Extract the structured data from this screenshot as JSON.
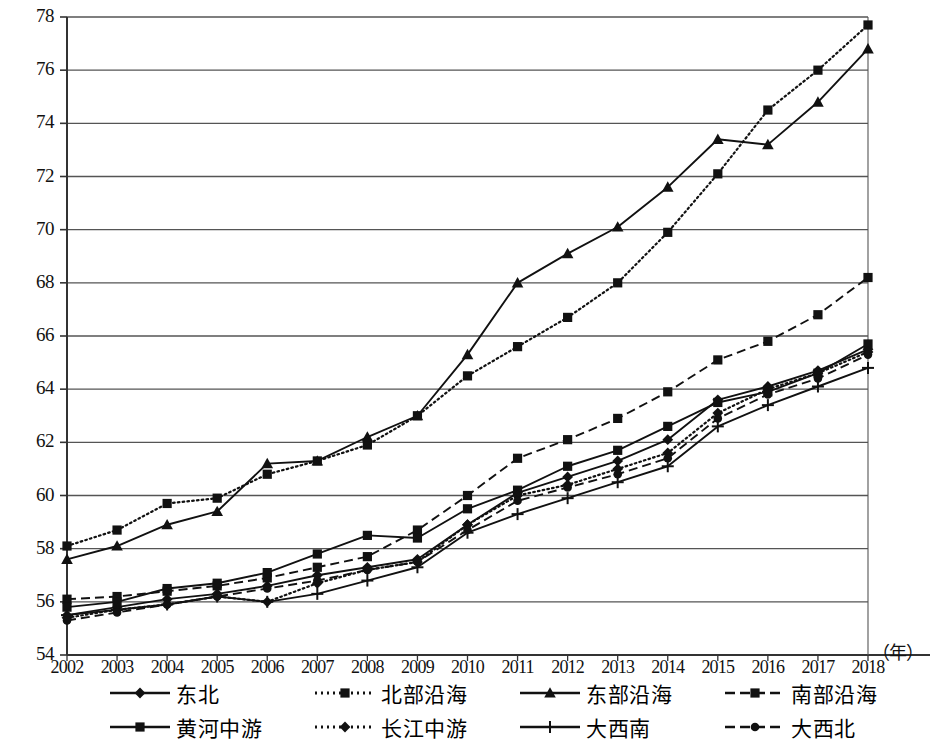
{
  "chart_data": {
    "type": "line",
    "title": "",
    "xlabel": "（年）",
    "ylabel": "",
    "grid": true,
    "legend_position": "bottom",
    "xlim": [
      2002,
      2018
    ],
    "ylim": [
      54,
      78
    ],
    "yticks": [
      54,
      56,
      58,
      60,
      62,
      64,
      66,
      68,
      70,
      72,
      74,
      76,
      78
    ],
    "categories": [
      "2002",
      "2003",
      "2004",
      "2005",
      "2006",
      "2007",
      "2008",
      "2009",
      "2010",
      "2011",
      "2012",
      "2013",
      "2014",
      "2015",
      "2016",
      "2017",
      "2018"
    ],
    "series": [
      {
        "name": "东北",
        "marker": "diamond",
        "line": "solid",
        "values": [
          55.5,
          55.8,
          56.1,
          56.3,
          56.6,
          57.0,
          57.3,
          57.6,
          58.9,
          60.1,
          60.7,
          61.3,
          62.1,
          63.6,
          64.1,
          64.7,
          65.5
        ]
      },
      {
        "name": "北部沿海",
        "marker": "square",
        "line": "dotted",
        "values": [
          58.1,
          58.7,
          59.7,
          59.9,
          60.8,
          61.3,
          61.9,
          63.0,
          64.5,
          65.6,
          66.7,
          68.0,
          69.9,
          72.1,
          74.5,
          76.0,
          77.7
        ]
      },
      {
        "name": "东部沿海",
        "marker": "triangle",
        "line": "solid",
        "values": [
          57.6,
          58.1,
          58.9,
          59.4,
          61.2,
          61.3,
          62.2,
          63.0,
          65.3,
          68.0,
          69.1,
          70.1,
          71.6,
          73.4,
          73.2,
          74.8,
          76.8
        ]
      },
      {
        "name": "南部沿海",
        "marker": "square",
        "line": "dashed",
        "values": [
          56.1,
          56.2,
          56.4,
          56.6,
          56.9,
          57.3,
          57.7,
          58.7,
          60.0,
          61.4,
          62.1,
          62.9,
          63.9,
          65.1,
          65.8,
          66.8,
          68.2
        ]
      },
      {
        "name": "黄河中游",
        "marker": "square",
        "line": "solid",
        "values": [
          55.8,
          56.0,
          56.5,
          56.7,
          57.1,
          57.8,
          58.5,
          58.4,
          59.5,
          60.2,
          61.1,
          61.7,
          62.6,
          63.5,
          63.9,
          64.6,
          65.7
        ]
      },
      {
        "name": "长江中游",
        "marker": "diamond",
        "line": "dotted",
        "values": [
          55.4,
          55.7,
          55.9,
          56.2,
          56.0,
          56.7,
          57.2,
          57.5,
          58.9,
          60.0,
          60.4,
          61.0,
          61.6,
          63.1,
          64.0,
          64.6,
          65.4
        ]
      },
      {
        "name": "大西南",
        "marker": "plus",
        "line": "solid",
        "values": [
          55.5,
          55.7,
          55.9,
          56.2,
          56.0,
          56.3,
          56.8,
          57.3,
          58.6,
          59.3,
          59.9,
          60.5,
          61.1,
          62.6,
          63.4,
          64.1,
          64.8
        ]
      },
      {
        "name": "大西北",
        "marker": "circle",
        "line": "dashed",
        "values": [
          55.3,
          55.6,
          55.9,
          56.2,
          56.5,
          56.8,
          57.2,
          57.5,
          58.7,
          59.8,
          60.3,
          60.8,
          61.4,
          62.9,
          63.8,
          64.4,
          65.3
        ]
      }
    ]
  },
  "legend": {
    "row1": [
      {
        "label": "东北",
        "marker": "diamond",
        "line": "solid"
      },
      {
        "label": "北部沿海",
        "marker": "square",
        "line": "dotted"
      },
      {
        "label": "东部沿海",
        "marker": "triangle",
        "line": "solid"
      },
      {
        "label": "南部沿海",
        "marker": "square",
        "line": "dashed"
      }
    ],
    "row2": [
      {
        "label": "黄河中游",
        "marker": "square",
        "line": "solid"
      },
      {
        "label": "长江中游",
        "marker": "diamond",
        "line": "dotted"
      },
      {
        "label": "大西南",
        "marker": "plus",
        "line": "solid"
      },
      {
        "label": "大西北",
        "marker": "circle",
        "line": "dashed"
      }
    ]
  },
  "axis": {
    "unit_label": "（年）"
  },
  "colors": {
    "line": "#111111",
    "grid": "#555555",
    "axis": "#333333",
    "background": "#ffffff"
  }
}
